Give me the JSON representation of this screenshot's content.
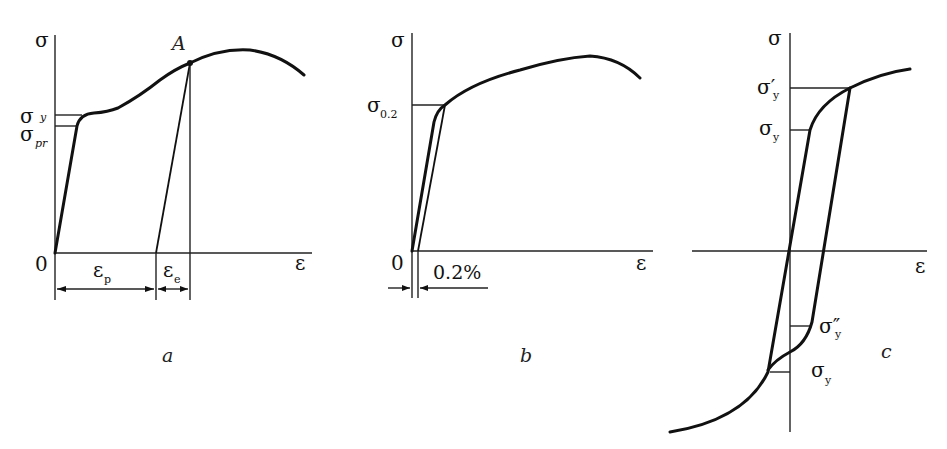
{
  "panels": [
    {
      "id": "a",
      "caption": "a",
      "axis_y_label": "σ",
      "axis_x_label": "ε",
      "origin_label": "0",
      "point_label": "A",
      "levels": [
        {
          "symbol": "σ",
          "subscript": "y"
        },
        {
          "symbol": "σ",
          "subscript": "pr"
        }
      ],
      "dimensions": [
        {
          "symbol": "ε",
          "subscript": "p"
        },
        {
          "symbol": "ε",
          "subscript": "e"
        }
      ]
    },
    {
      "id": "b",
      "caption": "b",
      "axis_y_label": "σ",
      "axis_x_label": "ε",
      "origin_label": "0",
      "levels": [
        {
          "symbol": "σ",
          "subscript": "0.2"
        }
      ],
      "offset_label": "0.2%"
    },
    {
      "id": "c",
      "caption": "c",
      "axis_y_label": "σ",
      "axis_x_label": "ε",
      "levels": [
        {
          "symbol": "σ′",
          "subscript": "y"
        },
        {
          "symbol": "σ",
          "subscript": "y"
        },
        {
          "symbol": "σ″",
          "subscript": "y"
        },
        {
          "symbol": "σ",
          "subscript": "y"
        }
      ]
    }
  ]
}
